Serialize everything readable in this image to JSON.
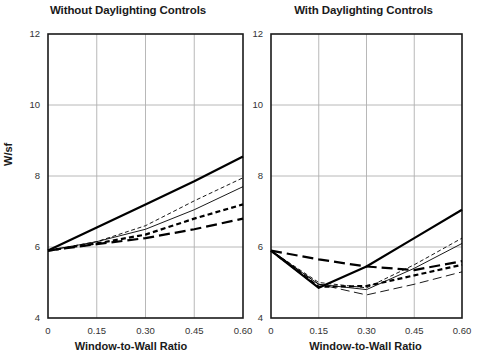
{
  "figure": {
    "ylabel": "W/sf",
    "xlabel": "Window-to-Wall Ratio",
    "background": "#ffffff",
    "axis_color": "#1a1a1a",
    "grid_color": "#b0b0b0",
    "line_color": "#000000"
  },
  "panels": [
    {
      "id": "left",
      "title": "Without Daylighting Controls"
    },
    {
      "id": "right",
      "title": "With Daylighting Controls"
    }
  ],
  "axes": {
    "y_ticks": [
      "12",
      "10",
      "8",
      "6",
      "4"
    ],
    "x_ticks": [
      "0",
      "0.15",
      "0.30",
      "0.45",
      "0.60"
    ]
  },
  "chart_data": [
    {
      "type": "line",
      "title": "Without Daylighting Controls",
      "xlabel": "Window-to-Wall Ratio",
      "ylabel": "W/sf",
      "xlim": [
        0,
        0.6
      ],
      "ylim": [
        4,
        12
      ],
      "x": [
        0,
        0.15,
        0.3,
        0.45,
        0.6
      ],
      "xtick_labels": [
        "0",
        "0.15",
        "0.30",
        "0.45",
        "0.60"
      ],
      "ytick_labels": [
        "12",
        "10",
        "8",
        "6",
        "4"
      ],
      "grid": true,
      "legend": "none",
      "series": [
        {
          "name": "thick-solid",
          "style": "solid",
          "width": 2.2,
          "values": [
            5.9,
            6.55,
            7.2,
            7.85,
            8.55
          ]
        },
        {
          "name": "thin-dashed-short",
          "style": "dashed-fine",
          "width": 0.9,
          "values": [
            5.9,
            6.15,
            6.6,
            7.3,
            7.95
          ]
        },
        {
          "name": "thin-solid",
          "style": "solid",
          "width": 0.9,
          "values": [
            5.9,
            6.15,
            6.5,
            7.05,
            7.7
          ]
        },
        {
          "name": "thick-dashed",
          "style": "dashed",
          "width": 2.2,
          "values": [
            5.9,
            6.1,
            6.35,
            6.8,
            7.2
          ]
        },
        {
          "name": "thick-long-dashed",
          "style": "long-dashed",
          "width": 2.2,
          "values": [
            5.9,
            6.08,
            6.25,
            6.5,
            6.8
          ]
        }
      ]
    },
    {
      "type": "line",
      "title": "With Daylighting Controls",
      "xlabel": "Window-to-Wall Ratio",
      "ylabel": "W/sf",
      "xlim": [
        0,
        0.6
      ],
      "ylim": [
        4,
        12
      ],
      "x": [
        0,
        0.15,
        0.3,
        0.45,
        0.6
      ],
      "xtick_labels": [
        "0",
        "0.15",
        "0.30",
        "0.45",
        "0.60"
      ],
      "ytick_labels": [
        "12",
        "10",
        "8",
        "6",
        "4"
      ],
      "grid": true,
      "legend": "none",
      "series": [
        {
          "name": "thick-solid",
          "style": "solid",
          "width": 2.2,
          "values": [
            5.9,
            4.85,
            5.45,
            6.25,
            7.05
          ]
        },
        {
          "name": "thick-long-dashed",
          "style": "long-dashed",
          "width": 2.2,
          "values": [
            5.9,
            5.65,
            5.45,
            5.35,
            5.6
          ]
        },
        {
          "name": "thin-dashed-short",
          "style": "dashed-fine",
          "width": 0.9,
          "values": [
            5.9,
            5.0,
            4.85,
            5.5,
            6.25
          ]
        },
        {
          "name": "thin-solid",
          "style": "solid",
          "width": 0.9,
          "values": [
            5.9,
            4.95,
            4.8,
            5.4,
            6.1
          ]
        },
        {
          "name": "thick-dashed",
          "style": "dashed",
          "width": 2.2,
          "values": [
            5.9,
            4.88,
            4.9,
            5.2,
            5.5
          ]
        },
        {
          "name": "thin-long-dashed",
          "style": "long-dash-fine",
          "width": 0.9,
          "values": [
            5.9,
            4.95,
            4.65,
            4.95,
            5.3
          ]
        }
      ]
    }
  ]
}
